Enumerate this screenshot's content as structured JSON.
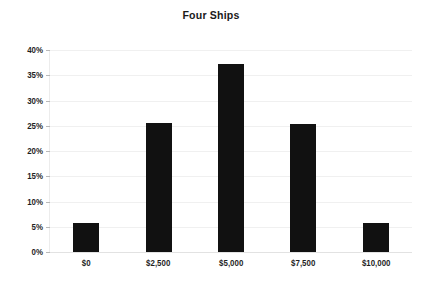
{
  "chart_data": {
    "type": "bar",
    "title": "Four Ships",
    "xlabel": "",
    "ylabel": "",
    "categories": [
      "$0",
      "$2,500",
      "$5,000",
      "$7,500",
      "$10,000"
    ],
    "values": [
      5.8,
      25.5,
      37.2,
      25.4,
      5.7
    ],
    "ylim": [
      0,
      40
    ],
    "ytick_labels": [
      "40%",
      "35%",
      "30%",
      "25%",
      "20%",
      "15%",
      "10%",
      "5%",
      "0%"
    ],
    "ytick_values": [
      40,
      35,
      30,
      25,
      20,
      15,
      10,
      5,
      0
    ],
    "ytick_step": 5,
    "grid": true,
    "legend": false,
    "legend_position": "none",
    "bar_color": "#111111",
    "gridline_color": "#f0f0f0",
    "axis_color": "#ececec",
    "text_color": "#1f1f1f",
    "background_color": "#ffffff"
  }
}
